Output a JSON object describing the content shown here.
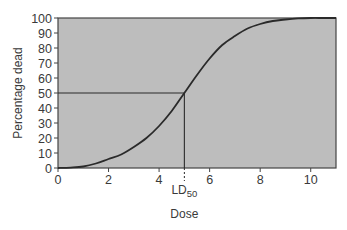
{
  "chart_data": {
    "type": "line",
    "title": "",
    "xlabel": "Dose",
    "ylabel": "Percentage dead",
    "xlim": [
      0,
      11
    ],
    "ylim": [
      0,
      100
    ],
    "x_ticks": [
      0,
      2,
      4,
      6,
      8,
      10
    ],
    "y_ticks": [
      0,
      10,
      20,
      30,
      40,
      50,
      60,
      70,
      80,
      90,
      100
    ],
    "grid": false,
    "legend": null,
    "series": [
      {
        "name": "Dose-response curve",
        "x": [
          0,
          0.5,
          1,
          1.5,
          2,
          2.5,
          3,
          3.5,
          4,
          4.5,
          5,
          5.5,
          6,
          6.5,
          7,
          7.5,
          8,
          8.5,
          9,
          9.5,
          10,
          10.5,
          11
        ],
        "y": [
          0,
          0.3,
          1,
          3,
          6,
          9,
          14,
          20,
          28,
          38,
          50,
          62,
          73,
          82,
          88,
          93,
          96,
          98,
          99,
          99.7,
          100,
          100,
          100
        ]
      }
    ],
    "annotations": [
      {
        "type": "hline",
        "y": 50,
        "x_from": 0,
        "x_to": 5,
        "style": "solid"
      },
      {
        "type": "vline",
        "x": 5,
        "y_from": 0,
        "y_to": 50,
        "style": "solid"
      },
      {
        "type": "vline",
        "x": 5,
        "below_axis": true,
        "style": "dashed"
      },
      {
        "type": "label",
        "text": "LD",
        "subscript": "50",
        "x": 5
      }
    ],
    "colors": {
      "plot_background": "#bdbdbd",
      "line": "#2a2a2a",
      "axis": "#444444"
    }
  }
}
